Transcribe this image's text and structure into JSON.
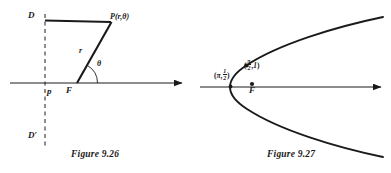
{
  "page": {
    "width": 391,
    "height": 173,
    "background_color": "#ffffff",
    "ink_color": "#1a1a1a"
  },
  "figures": [
    {
      "id": "figure-9-26",
      "caption": "Figure 9.26",
      "description": "Polar conic focus-directrix diagram",
      "labels": {
        "directrix_top": "D",
        "directrix_bottom": "D′",
        "point_P": "P(r,θ)",
        "radius": "r",
        "angle": "θ",
        "distance_p": "p",
        "focus": "F"
      },
      "geometry": {
        "axis": {
          "x1": 10,
          "y1": 83,
          "x2": 185,
          "y2": 83,
          "arrow": "right"
        },
        "directrix": {
          "x": 45,
          "y1": 14,
          "y2": 147,
          "style": "dashed"
        },
        "segment_DP": {
          "x1": 45,
          "y1": 20,
          "x2": 112,
          "y2": 22
        },
        "segment_FP": {
          "x1": 77,
          "y1": 83,
          "x2": 112,
          "y2": 22
        },
        "angle_arc": {
          "cx": 77,
          "cy": 83,
          "radius": 20,
          "from_deg": 0,
          "to_deg": 60
        },
        "focus_point": {
          "x": 77,
          "y": 83
        }
      }
    },
    {
      "id": "figure-9-27",
      "caption": "Figure 9.27",
      "description": "Left-opening parabola in polar coordinates with focus F",
      "labels": {
        "vertex_point": {
          "open": "(",
          "theta": "π",
          "comma": ",",
          "r_num": "1",
          "r_den": "2",
          "close": ")"
        },
        "upper_point": {
          "open": "(",
          "theta_num": "π",
          "theta_den": "2",
          "comma": ",",
          "r": "1",
          "close": ")"
        },
        "focus": "F"
      },
      "geometry": {
        "axis": {
          "x1": 5,
          "y1": 87,
          "x2": 190,
          "y2": 87,
          "arrow": "right"
        },
        "parabola": {
          "vertex": {
            "x": 35,
            "y": 87
          },
          "opens": "left",
          "upper_end": {
            "x": 188,
            "y": 18
          },
          "lower_end": {
            "x": 188,
            "y": 156
          }
        },
        "marked_points": [
          {
            "name": "vertex",
            "x": 35,
            "y": 87
          },
          {
            "name": "upper",
            "x": 51,
            "y": 66
          },
          {
            "name": "focus",
            "x": 57,
            "y": 84
          }
        ]
      }
    }
  ]
}
